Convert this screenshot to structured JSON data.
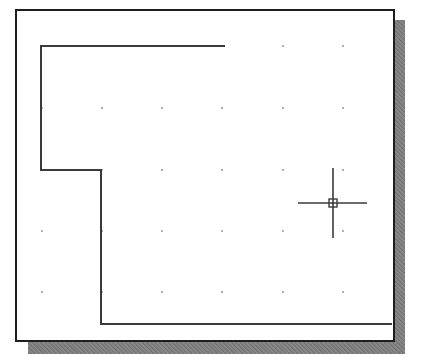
{
  "drawing": {
    "background_color": "#ffffff",
    "frame_color": "#1e1e1e",
    "shadow_color": "#808080",
    "line_color": "#3a3a3a",
    "grid_dot_color": "#8a8a8a",
    "grid": {
      "x": [
        42,
        102,
        162,
        222,
        283,
        343
      ],
      "y": [
        46,
        108,
        170,
        231,
        292
      ]
    },
    "polyline": {
      "points": [
        [
          225,
          46
        ],
        [
          41,
          46
        ],
        [
          41,
          170
        ],
        [
          101,
          170
        ],
        [
          101,
          324
        ],
        [
          392,
          324
        ]
      ]
    },
    "crosshair": {
      "cx": 333,
      "cy": 203,
      "h_from": 298,
      "h_to": 367,
      "v_from": 168,
      "v_to": 238,
      "pickbox_size": 8
    }
  }
}
